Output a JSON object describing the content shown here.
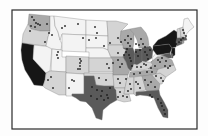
{
  "map": {
    "type": "choropleth-with-points",
    "region": "Contiguous United States",
    "frame": {
      "x": 12,
      "y": 10,
      "w": 185,
      "h": 119
    },
    "shades": {
      "1": "#f3f3f3",
      "2": "#d4d4d4",
      "3": "#a9a9a9",
      "4": "#5a5a5a",
      "5": "#161616"
    },
    "states": [
      {
        "id": "WA",
        "level": 3,
        "points": "29,14 50,16 50,31 40,31 31,29 28,24"
      },
      {
        "id": "OR",
        "level": 2,
        "points": "28,24 31,29 40,31 50,31 48,37 46,46 22,43 23,34"
      },
      {
        "id": "CA",
        "level": 5,
        "points": "22,43 34,45 33,59 46,73 45,80 43,86 34,85 30,78 25,70 22,60 21,50"
      },
      {
        "id": "NV",
        "level": 1,
        "points": "34,45 52,47 50,71 46,73 33,59"
      },
      {
        "id": "ID",
        "level": 1,
        "points": "50,16 54,16 55,26 58,32 60,40 62,44 61,50 52,49 46,46 48,37 50,31"
      },
      {
        "id": "MT",
        "level": 1,
        "points": "54,16 86,20 86,35 62,34 60,40 58,32 55,26"
      },
      {
        "id": "WY",
        "level": 1,
        "points": "62,34 86,35 86,52 62,51"
      },
      {
        "id": "UT",
        "level": 1,
        "points": "52,49 62,50 62,57 66,57 66,72 51,71"
      },
      {
        "id": "CO",
        "level": 2,
        "points": "66,56 89,57 89,74 66,73"
      },
      {
        "id": "AZ",
        "level": 2,
        "points": "51,71 66,72 66,95 59,95 45,88 43,86 45,80 46,73 50,71"
      },
      {
        "id": "NM",
        "level": 1,
        "points": "66,73 84,74 84,94 72,94 72,96 66,96"
      },
      {
        "id": "ND",
        "level": 1,
        "points": "86,20 107,21 108,36 86,35"
      },
      {
        "id": "SD",
        "level": 1,
        "points": "86,35 108,36 108,50 103,48 86,48"
      },
      {
        "id": "NE",
        "level": 1,
        "points": "86,48 103,48 108,50 111,58 89,58 89,52 86,52"
      },
      {
        "id": "KS",
        "level": 2,
        "points": "89,58 111,58 113,60 113,72 89,72"
      },
      {
        "id": "OK",
        "level": 2,
        "points": "84,73 113,73 114,86 104,86 96,85 94,76 84,76"
      },
      {
        "id": "TX",
        "level": 4,
        "points": "84,76 94,76 96,85 104,86 114,86 116,90 117,100 110,104 103,110 102,120 96,118 92,108 86,102 80,101 76,98 72,96 72,94 84,94"
      },
      {
        "id": "MN",
        "level": 2,
        "points": "107,21 116,21 128,24 121,31 120,40 123,45 108,45 108,36"
      },
      {
        "id": "IA",
        "level": 2,
        "points": "108,45 123,45 126,50 123,57 111,57 108,50"
      },
      {
        "id": "MO",
        "level": 3,
        "points": "111,57 123,57 126,62 130,70 128,75 113,75 113,60"
      },
      {
        "id": "AR",
        "level": 2,
        "points": "113,75 128,75 127,80 125,88 114,88 114,86"
      },
      {
        "id": "LA",
        "level": 2,
        "points": "114,88 125,88 124,94 129,94 131,101 124,102 117,100 116,90"
      },
      {
        "id": "WI",
        "level": 3,
        "points": "121,31 130,29 134,34 134,42 133,48 123,48 123,45 120,40"
      },
      {
        "id": "IL",
        "level": 4,
        "points": "123,48 133,48 135,54 134,64 131,71 128,68 126,62 123,57 126,50"
      },
      {
        "id": "MI",
        "level": 3,
        "points": "130,29 141,27 146,33 148,38 149,45 146,48 139,48 137,40 134,34"
      },
      {
        "id": "IN",
        "level": 4,
        "points": "135,49 142,49 142,62 137,65 134,64"
      },
      {
        "id": "OH",
        "level": 4,
        "points": "142,48 150,46 153,50 152,58 146,62 142,61"
      },
      {
        "id": "KY",
        "level": 2,
        "points": "131,71 134,64 137,65 142,62 146,62 151,62 153,65 148,69 133,71"
      },
      {
        "id": "TN",
        "level": 3,
        "points": "130,72 148,70 158,69 156,74 145,76 129,77"
      },
      {
        "id": "MS",
        "level": 2,
        "points": "127,78 134,77 134,94 129,94 124,94 125,88"
      },
      {
        "id": "AL",
        "level": 2,
        "points": "134,77 142,76 146,90 136,92 136,96 134,94"
      },
      {
        "id": "GA",
        "level": 3,
        "points": "142,76 152,75 160,84 159,90 147,91 146,90"
      },
      {
        "id": "FL",
        "level": 4,
        "points": "136,92 147,91 159,90 160,95 164,102 168,110 168,118 163,117 158,108 154,98 148,96 140,95 136,96"
      },
      {
        "id": "SC",
        "level": 2,
        "points": "152,75 160,73 166,77 162,84 160,84"
      },
      {
        "id": "NC",
        "level": 2,
        "points": "156,74 158,69 174,65 176,70 166,77 160,73"
      },
      {
        "id": "VA",
        "level": 3,
        "points": "151,62 157,57 164,56 172,60 174,65 158,69 148,69 153,65"
      },
      {
        "id": "WV",
        "level": 1,
        "points": "152,58 157,52 160,55 157,57 151,62 153,60"
      },
      {
        "id": "PA",
        "level": 5,
        "points": "153,46 169,44 172,48 170,53 157,55 153,50"
      },
      {
        "id": "NY",
        "level": 5,
        "points": "153,46 158,40 166,36 174,30 177,32 178,42 176,47 172,48 169,44"
      },
      {
        "id": "MD",
        "level": 4,
        "points": "160,55 170,53 172,58 168,58 164,56"
      },
      {
        "id": "NJ",
        "level": 5,
        "points": "172,48 175,48 175,55 172,57 171,53"
      },
      {
        "id": "DE",
        "level": 4,
        "points": "171,53 173,54 173,58 172,58"
      },
      {
        "id": "CT",
        "level": 4,
        "points": "176,42 182,41 182,44 177,46"
      },
      {
        "id": "RI",
        "level": 3,
        "points": "182,41 184,41 184,43 182,44"
      },
      {
        "id": "MA",
        "level": 4,
        "points": "177,38 186,37 187,40 182,41 176,42"
      },
      {
        "id": "VT",
        "level": 2,
        "points": "177,29 180,28 181,37 177,38"
      },
      {
        "id": "NH",
        "level": 2,
        "points": "180,28 183,27 185,36 181,37"
      },
      {
        "id": "ME",
        "level": 1,
        "points": "183,27 184,19 188,18 191,23 194,27 189,31 185,36"
      }
    ],
    "points": [
      [
        32,
        17
      ],
      [
        34,
        20
      ],
      [
        36,
        23
      ],
      [
        38,
        24
      ],
      [
        31,
        26
      ],
      [
        35,
        27
      ],
      [
        40,
        25
      ],
      [
        47,
        24
      ],
      [
        30,
        31
      ],
      [
        49,
        33
      ],
      [
        45,
        42
      ],
      [
        52,
        35
      ],
      [
        62,
        28
      ],
      [
        65,
        26
      ],
      [
        78,
        24
      ],
      [
        95,
        27
      ],
      [
        97,
        33
      ],
      [
        89,
        40
      ],
      [
        96,
        38
      ],
      [
        83,
        38
      ],
      [
        58,
        52
      ],
      [
        57,
        55
      ],
      [
        58,
        58
      ],
      [
        80,
        59
      ],
      [
        81,
        61
      ],
      [
        80,
        63
      ],
      [
        80,
        66
      ],
      [
        80,
        69
      ],
      [
        78,
        69
      ],
      [
        72,
        80
      ],
      [
        74,
        81
      ],
      [
        69,
        88
      ],
      [
        51,
        77
      ],
      [
        48,
        80
      ],
      [
        53,
        88
      ],
      [
        104,
        46
      ],
      [
        110,
        43
      ],
      [
        118,
        38
      ],
      [
        121,
        42
      ],
      [
        125,
        40
      ],
      [
        128,
        36
      ],
      [
        128,
        43
      ],
      [
        130,
        46
      ],
      [
        127,
        49
      ],
      [
        131,
        39
      ],
      [
        136,
        44
      ],
      [
        139,
        45
      ],
      [
        141,
        39
      ],
      [
        143,
        44
      ],
      [
        145,
        47
      ],
      [
        118,
        53
      ],
      [
        124,
        55
      ],
      [
        126,
        52
      ],
      [
        129,
        55
      ],
      [
        130,
        58
      ],
      [
        131,
        61
      ],
      [
        132,
        66
      ],
      [
        122,
        64
      ],
      [
        120,
        67
      ],
      [
        118,
        60
      ],
      [
        113,
        63
      ],
      [
        107,
        64
      ],
      [
        109,
        68
      ],
      [
        136,
        52
      ],
      [
        138,
        56
      ],
      [
        140,
        50
      ],
      [
        145,
        52
      ],
      [
        147,
        55
      ],
      [
        148,
        59
      ],
      [
        150,
        50
      ],
      [
        158,
        44
      ],
      [
        161,
        42
      ],
      [
        164,
        40
      ],
      [
        166,
        38
      ],
      [
        170,
        37
      ],
      [
        174,
        40
      ],
      [
        176,
        44
      ],
      [
        163,
        48
      ],
      [
        166,
        47
      ],
      [
        160,
        50
      ],
      [
        168,
        50
      ],
      [
        173,
        50
      ],
      [
        179,
        42
      ],
      [
        181,
        40
      ],
      [
        183,
        38
      ],
      [
        186,
        36
      ],
      [
        184,
        33
      ],
      [
        183,
        30
      ],
      [
        158,
        60
      ],
      [
        162,
        58
      ],
      [
        166,
        61
      ],
      [
        160,
        62
      ],
      [
        165,
        66
      ],
      [
        168,
        68
      ],
      [
        170,
        66
      ],
      [
        155,
        66
      ],
      [
        151,
        68
      ],
      [
        137,
        67
      ],
      [
        141,
        67
      ],
      [
        144,
        64
      ],
      [
        146,
        65
      ],
      [
        134,
        74
      ],
      [
        140,
        73
      ],
      [
        147,
        72
      ],
      [
        152,
        72
      ],
      [
        156,
        76
      ],
      [
        161,
        78
      ],
      [
        163,
        81
      ],
      [
        126,
        79
      ],
      [
        118,
        79
      ],
      [
        120,
        83
      ],
      [
        106,
        80
      ],
      [
        99,
        78
      ],
      [
        130,
        84
      ],
      [
        131,
        89
      ],
      [
        128,
        91
      ],
      [
        136,
        82
      ],
      [
        138,
        84
      ],
      [
        140,
        88
      ],
      [
        145,
        80
      ],
      [
        148,
        85
      ],
      [
        151,
        82
      ],
      [
        155,
        87
      ],
      [
        120,
        92
      ],
      [
        123,
        96
      ],
      [
        127,
        97
      ],
      [
        118,
        97
      ],
      [
        92,
        87
      ],
      [
        97,
        90
      ],
      [
        102,
        91
      ],
      [
        107,
        95
      ],
      [
        101,
        96
      ],
      [
        97,
        99
      ],
      [
        104,
        100
      ],
      [
        108,
        98
      ],
      [
        110,
        88
      ],
      [
        91,
        96
      ],
      [
        150,
        95
      ],
      [
        152,
        97
      ],
      [
        158,
        99
      ],
      [
        161,
        103
      ],
      [
        162,
        106
      ],
      [
        164,
        110
      ],
      [
        165,
        114
      ]
    ]
  }
}
